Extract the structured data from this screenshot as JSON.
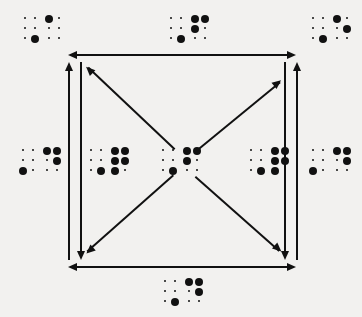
{
  "diagram": {
    "background_color": "#f2f1ef",
    "ink_color": "#111111",
    "square": {
      "left": 68,
      "top": 55,
      "right": 296,
      "bottom": 266
    },
    "nodes": [
      {
        "id": "top-left",
        "name": "glyph-top-left",
        "x": 22,
        "y": 14,
        "cells": [
          {
            "large": [
              "c2r3"
            ],
            "small": [
              "c1r1",
              "c2r1",
              "c1r2",
              "c2r2",
              "c1r3"
            ]
          },
          {
            "large": [
              "c1r1"
            ],
            "small": [
              "c2r1",
              "c1r2",
              "c2r2",
              "c1r3",
              "c2r3"
            ]
          }
        ]
      },
      {
        "id": "top-center",
        "name": "glyph-top-center",
        "x": 168,
        "y": 14,
        "cells": [
          {
            "large": [
              "c2r3"
            ],
            "small": [
              "c1r1",
              "c2r1",
              "c1r2",
              "c2r2",
              "c1r3"
            ]
          },
          {
            "large": [
              "c1r1",
              "c2r1",
              "c1r2"
            ],
            "small": [
              "c2r2",
              "c1r3",
              "c2r3"
            ]
          }
        ]
      },
      {
        "id": "top-right",
        "name": "glyph-top-right",
        "x": 310,
        "y": 14,
        "cells": [
          {
            "large": [
              "c2r3"
            ],
            "small": [
              "c1r1",
              "c2r1",
              "c1r2",
              "c2r2",
              "c1r3"
            ]
          },
          {
            "large": [
              "c1r1",
              "c2r2"
            ],
            "small": [
              "c2r1",
              "c1r2",
              "c1r3",
              "c2r3"
            ]
          }
        ]
      },
      {
        "id": "left-outer",
        "name": "glyph-left-outer",
        "x": 20,
        "y": 146,
        "cells": [
          {
            "large": [
              "c1r3"
            ],
            "small": [
              "c1r1",
              "c2r1",
              "c1r2",
              "c2r2",
              "c2r3"
            ]
          },
          {
            "large": [
              "c1r1",
              "c2r1",
              "c2r2"
            ],
            "small": [
              "c1r2",
              "c1r3",
              "c2r3"
            ]
          }
        ]
      },
      {
        "id": "left-inner",
        "name": "glyph-left-inner",
        "x": 88,
        "y": 146,
        "cells": [
          {
            "large": [
              "c2r3"
            ],
            "small": [
              "c1r1",
              "c2r1",
              "c1r2",
              "c2r2",
              "c1r3"
            ]
          },
          {
            "large": [
              "c1r1",
              "c2r1",
              "c1r2",
              "c2r2",
              "c1r3"
            ],
            "small": [
              "c2r3"
            ]
          }
        ]
      },
      {
        "id": "center",
        "name": "glyph-center",
        "x": 160,
        "y": 146,
        "cells": [
          {
            "large": [
              "c2r3"
            ],
            "small": [
              "c1r1",
              "c2r1",
              "c1r2",
              "c2r2",
              "c1r3"
            ]
          },
          {
            "large": [
              "c1r1",
              "c2r1",
              "c1r2"
            ],
            "small": [
              "c2r2",
              "c1r3",
              "c2r3"
            ]
          }
        ]
      },
      {
        "id": "right-inner",
        "name": "glyph-right-inner",
        "x": 248,
        "y": 146,
        "cells": [
          {
            "large": [
              "c2r3"
            ],
            "small": [
              "c1r1",
              "c2r1",
              "c1r2",
              "c2r2",
              "c1r3"
            ]
          },
          {
            "large": [
              "c1r1",
              "c2r1",
              "c1r2",
              "c2r2",
              "c1r3"
            ],
            "small": [
              "c2r3"
            ]
          }
        ]
      },
      {
        "id": "right-outer",
        "name": "glyph-right-outer",
        "x": 310,
        "y": 146,
        "cells": [
          {
            "large": [
              "c1r3"
            ],
            "small": [
              "c1r1",
              "c2r1",
              "c1r2",
              "c2r2",
              "c2r3"
            ]
          },
          {
            "large": [
              "c1r1",
              "c2r1",
              "c2r2"
            ],
            "small": [
              "c1r2",
              "c1r3",
              "c2r3"
            ]
          }
        ]
      },
      {
        "id": "bottom-center",
        "name": "glyph-bottom-center",
        "x": 162,
        "y": 277,
        "cells": [
          {
            "large": [
              "c2r3"
            ],
            "small": [
              "c1r1",
              "c2r1",
              "c1r2",
              "c2r2",
              "c1r3"
            ]
          },
          {
            "large": [
              "c1r1",
              "c2r1",
              "c2r2"
            ],
            "small": [
              "c1r2",
              "c1r3",
              "c2r3"
            ]
          }
        ]
      }
    ],
    "connectors": [
      {
        "id": "top-edge",
        "name": "arrow-top-horizontal",
        "kind": "horizontal",
        "heads": "both"
      },
      {
        "id": "bottom-edge",
        "name": "arrow-bottom-horizontal",
        "kind": "horizontal",
        "heads": "both"
      },
      {
        "id": "left-up",
        "name": "arrow-left-up",
        "kind": "vertical",
        "heads": "up"
      },
      {
        "id": "left-down",
        "name": "arrow-left-down",
        "kind": "vertical",
        "heads": "down"
      },
      {
        "id": "right-down",
        "name": "arrow-right-down",
        "kind": "vertical",
        "heads": "down"
      },
      {
        "id": "right-up",
        "name": "arrow-right-up",
        "kind": "vertical",
        "heads": "up"
      },
      {
        "id": "diag-nw",
        "name": "arrow-diagonal-northwest",
        "kind": "diagonal",
        "heads": "single"
      },
      {
        "id": "diag-ne",
        "name": "arrow-diagonal-northeast",
        "kind": "diagonal",
        "heads": "single"
      },
      {
        "id": "diag-sw",
        "name": "arrow-diagonal-southwest",
        "kind": "diagonal",
        "heads": "single"
      },
      {
        "id": "diag-se",
        "name": "arrow-diagonal-southeast",
        "kind": "diagonal",
        "heads": "single"
      }
    ]
  }
}
